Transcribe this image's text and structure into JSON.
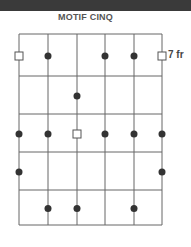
{
  "title": "MOTIF CINQ",
  "fret_label": "7 fr",
  "grid": {
    "strings": 6,
    "frets": 5,
    "string_x": [
      19,
      48,
      77,
      105,
      134,
      162
    ],
    "fret_y": [
      34,
      76,
      114,
      152,
      190,
      225
    ],
    "line_color": "#666666",
    "dot_color": "#333333"
  },
  "markers": [
    {
      "type": "root",
      "string": 1,
      "fret": 1
    },
    {
      "type": "dot",
      "string": 2,
      "fret": 1
    },
    {
      "type": "dot",
      "string": 4,
      "fret": 1
    },
    {
      "type": "dot",
      "string": 5,
      "fret": 1
    },
    {
      "type": "root",
      "string": 6,
      "fret": 1
    },
    {
      "type": "dot",
      "string": 3,
      "fret": 2
    },
    {
      "type": "dot",
      "string": 1,
      "fret": 3
    },
    {
      "type": "dot",
      "string": 2,
      "fret": 3
    },
    {
      "type": "root",
      "string": 3,
      "fret": 3
    },
    {
      "type": "dot",
      "string": 4,
      "fret": 3
    },
    {
      "type": "dot",
      "string": 5,
      "fret": 3
    },
    {
      "type": "dot",
      "string": 6,
      "fret": 3
    },
    {
      "type": "dot",
      "string": 1,
      "fret": 4
    },
    {
      "type": "dot",
      "string": 6,
      "fret": 4
    },
    {
      "type": "dot",
      "string": 2,
      "fret": 5
    },
    {
      "type": "dot",
      "string": 3,
      "fret": 5
    },
    {
      "type": "dot",
      "string": 5,
      "fret": 5
    }
  ]
}
